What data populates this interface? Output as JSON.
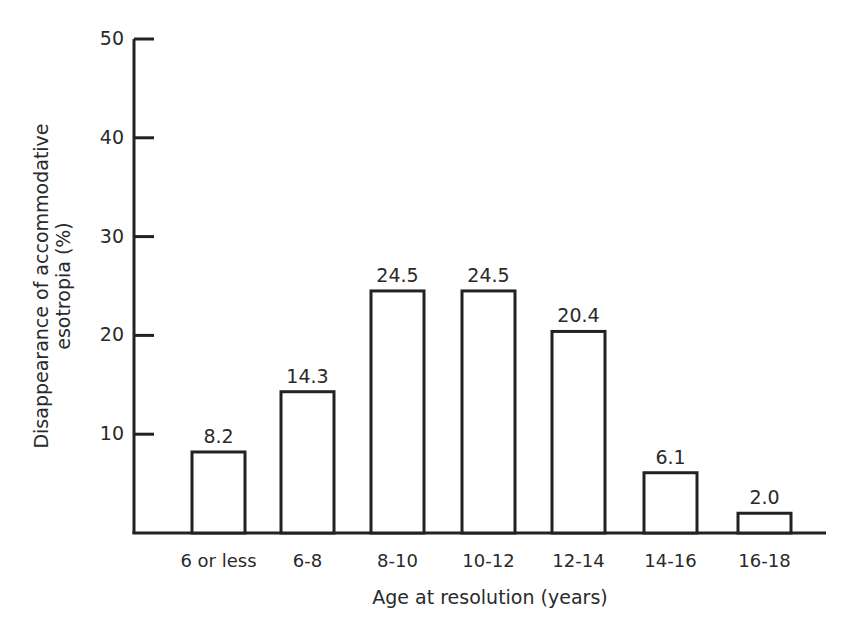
{
  "chart_data": {
    "type": "bar",
    "title": "",
    "xlabel": "Age at resolution (years)",
    "ylabel": "Disappearance of accommodative esotropia (%)",
    "ylabel_lines": [
      "Disappearance of accommodative",
      "esotropia (%)"
    ],
    "categories": [
      "6 or less",
      "6-8",
      "8-10",
      "10-12",
      "12-14",
      "14-16",
      "16-18"
    ],
    "values": [
      8.2,
      14.3,
      24.5,
      24.5,
      20.4,
      6.1,
      2.0
    ],
    "value_labels": [
      "8.2",
      "14.3",
      "24.5",
      "24.5",
      "20.4",
      "6.1",
      "2.0"
    ],
    "yticks": [
      10,
      20,
      30,
      40,
      50
    ],
    "ytick_labels": [
      "10",
      "20",
      "30",
      "40",
      "50"
    ],
    "ylim": [
      0,
      50
    ],
    "grid": false,
    "legend": null,
    "bar_fill": "#ffffff",
    "bar_stroke": "#222222"
  }
}
